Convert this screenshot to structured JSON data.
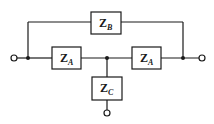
{
  "diagram": {
    "type": "two-port network (bridged-T)",
    "components": [
      {
        "id": "zb",
        "main": "Z",
        "sub": "B",
        "position": "top bridge"
      },
      {
        "id": "za_left",
        "main": "Z",
        "sub": "A",
        "position": "series left"
      },
      {
        "id": "za_right",
        "main": "Z",
        "sub": "A",
        "position": "series right"
      },
      {
        "id": "zc",
        "main": "Z",
        "sub": "C",
        "position": "shunt"
      }
    ],
    "terminals": [
      "left input",
      "right output",
      "bottom common"
    ],
    "colors": {
      "line": "#1a1a1a",
      "background": "#ffffff"
    }
  }
}
